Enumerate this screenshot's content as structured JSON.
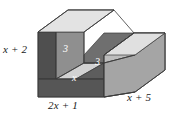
{
  "figure": {
    "type": "3d-solid-diagram",
    "shape_name": "U-shaped rectangular prism (channel solid)",
    "background_color": "#ffffff",
    "projection": "oblique",
    "faces": {
      "front_left_color": "#4a4a4a",
      "front_bottom_color": "#555555",
      "right_side_color": "#a8a8a8",
      "top_color": "#d8d8d8",
      "top_highlight_color": "#e6e6e6",
      "notch_inner_left_color": "#8d8d8d",
      "notch_inner_right_color": "#6e6e6e",
      "notch_floor_color": "#d0d0d0",
      "outline_color": "#3a3a3a"
    },
    "labels": {
      "height_left": "x + 2",
      "width_front": "2x + 1",
      "depth_right": "x + 5",
      "notch_depth_left": "3",
      "notch_depth_right": "3",
      "notch_width": "x"
    }
  }
}
